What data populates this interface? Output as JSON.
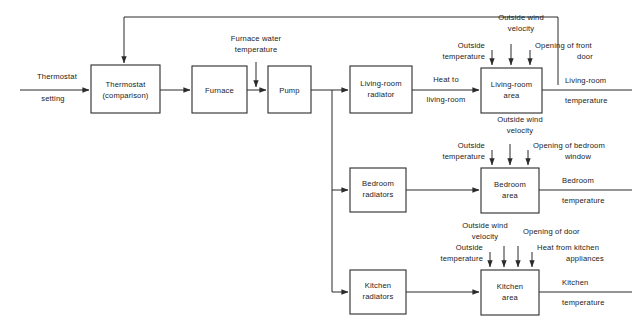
{
  "diagram": {
    "blocks": [
      {
        "id": "thermostat",
        "line1": "Thermostat",
        "line2": "(comparison)"
      },
      {
        "id": "furnace",
        "line1": "Furnace",
        "line2": ""
      },
      {
        "id": "pump",
        "line1": "Pump",
        "line2": ""
      },
      {
        "id": "living-room-radiator",
        "line1": "Living-room",
        "line2": "radiator"
      },
      {
        "id": "living-room-area",
        "line1": "Living-room",
        "line2": "area"
      },
      {
        "id": "bedroom-radiators",
        "line1": "Bedroom",
        "line2": "radiators"
      },
      {
        "id": "bedroom-area",
        "line1": "Bedroom",
        "line2": "area"
      },
      {
        "id": "kitchen-radiators",
        "line1": "Kitchen",
        "line2": "radiators"
      },
      {
        "id": "kitchen-area",
        "line1": "Kitchen",
        "line2": "area"
      }
    ],
    "signals": {
      "input_line1": "Thermostat",
      "input_line2": "setting",
      "furnace_water_line1": "Furnace water",
      "furnace_water_line2": "temperature",
      "heat_to_line1": "Heat  to",
      "heat_to_line2": "living-room",
      "living_room_out_line1": "Living-room",
      "living_room_out_line2": "temperature",
      "bedroom_out_line1": "Bedroom",
      "bedroom_out_line2": "temperature",
      "kitchen_out_line1": "Kitchen",
      "kitchen_out_line2": "temperature"
    },
    "disturbances": {
      "living_room": {
        "outside_temp_line1": "Outside",
        "outside_temp_line2": "temperature",
        "wind_line1": "Outside wind",
        "wind_line2": "velocity",
        "door_line1": "Opening of front",
        "door_line2": "door"
      },
      "bedroom": {
        "outside_temp_line1": "Outside",
        "outside_temp_line2": "temperature",
        "wind_line1": "Outside wind",
        "wind_line2": "velocity",
        "window_line1": "Opening of bedroom",
        "window_line2": "window"
      },
      "kitchen": {
        "outside_temp_line1": "Outside",
        "outside_temp_line2": "temperature",
        "wind_line1": "Outside wind",
        "wind_line2": "velocity",
        "door_line1": "Opening of door",
        "appliances_line1": "Heat from kitchen",
        "appliances_line2": "appliances"
      }
    },
    "colors": {
      "line": "#2b2b2b",
      "text": "#1a1a1a",
      "background": "#ffffff"
    }
  }
}
